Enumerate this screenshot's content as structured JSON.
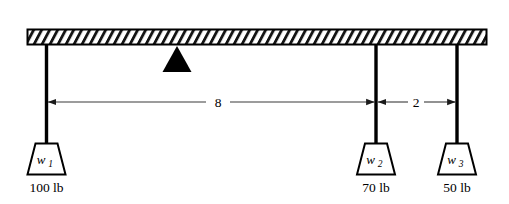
{
  "figure": {
    "kind": "mechanics-diagram",
    "colors": {
      "ink": "#000000",
      "background": "#ffffff",
      "hatch": "#1a1a1a",
      "dimension_line": "#3a3a3a"
    }
  },
  "beam": {
    "name": "horizontal-beam",
    "hatched": true,
    "x_left": 27,
    "x_right": 487,
    "y_top": 29,
    "y_bottom": 45
  },
  "fulcrum": {
    "name": "fulcrum-triangle",
    "apex_x": 177,
    "apex_y": 46,
    "base_left_x": 163,
    "base_right_x": 191,
    "base_y": 72
  },
  "weights": [
    {
      "id": "w1",
      "label": "w",
      "subscript": "1",
      "amount": "100 lb",
      "rod_x": 46,
      "rod_top_y": 45,
      "rod_bottom_y": 143,
      "box_top_y": 143,
      "box_bottom_y": 175,
      "box_top_half_width": 11,
      "box_bottom_half_width": 19,
      "amount_y": 192
    },
    {
      "id": "w2",
      "label": "w",
      "subscript": "2",
      "amount": "70 lb",
      "rod_x": 376,
      "rod_top_y": 45,
      "rod_bottom_y": 143,
      "box_top_y": 143,
      "box_bottom_y": 175,
      "box_top_half_width": 11,
      "box_bottom_half_width": 19,
      "amount_y": 192
    },
    {
      "id": "w3",
      "label": "w",
      "subscript": "3",
      "amount": "50 lb",
      "rod_x": 457,
      "rod_top_y": 45,
      "rod_bottom_y": 143,
      "box_top_y": 143,
      "box_bottom_y": 175,
      "box_top_half_width": 11,
      "box_bottom_half_width": 19,
      "amount_y": 192
    }
  ],
  "dimensions": [
    {
      "id": "dim-8",
      "value": "8",
      "from_x": 46,
      "to_x": 376,
      "y": 102,
      "label_x": 218,
      "label_y": 107,
      "gap_half": 12
    },
    {
      "id": "dim-2",
      "value": "2",
      "from_x": 376,
      "to_x": 457,
      "y": 102,
      "label_x": 416,
      "label_y": 107,
      "gap_half": 8
    }
  ]
}
